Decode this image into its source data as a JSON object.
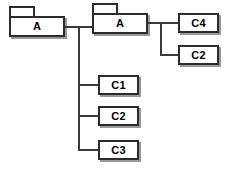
{
  "diagram": {
    "type": "package-hierarchy-tree",
    "background_color": "#ffffff",
    "line_color": "#3a3a3a",
    "border_color": "#2b2b2b",
    "shadow_color": "#9a9a9a",
    "nodes": {
      "package_a_left": {
        "label": "A",
        "shape": "package"
      },
      "package_a_mid": {
        "label": "A",
        "shape": "package"
      },
      "class_c4": {
        "label": "C4",
        "shape": "rectangle"
      },
      "class_c2_right": {
        "label": "C2",
        "shape": "rectangle"
      },
      "class_c1": {
        "label": "C1",
        "shape": "rectangle"
      },
      "class_c2_left": {
        "label": "C2",
        "shape": "rectangle"
      },
      "class_c3": {
        "label": "C3",
        "shape": "rectangle"
      }
    }
  }
}
